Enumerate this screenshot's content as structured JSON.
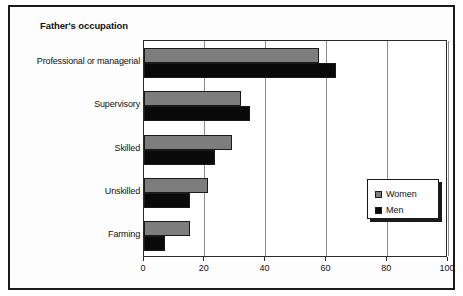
{
  "figure": {
    "title": "Father's occupation"
  },
  "chart_data": {
    "type": "bar",
    "orientation": "horizontal",
    "title": "Father's occupation",
    "xlabel": "",
    "ylabel": "",
    "xlim": [
      0,
      100
    ],
    "xticks": [
      0,
      20,
      40,
      60,
      80,
      100
    ],
    "xtick_labels": [
      "0",
      "20",
      "40",
      "60",
      "80",
      "100"
    ],
    "grid": "vertical",
    "legend_position": "lower-right",
    "categories": [
      "Professional or managerial",
      "Supervisory",
      "Skilled",
      "Unskilled",
      "Farming"
    ],
    "series": [
      {
        "name": "Women",
        "color": "#7d7d7d",
        "values": [
          57.5,
          32,
          29,
          21,
          15
        ]
      },
      {
        "name": "Men",
        "color": "#0a0a0a",
        "values": [
          63,
          35,
          23.5,
          15,
          7
        ]
      }
    ]
  },
  "legend": {
    "entries": [
      {
        "label": "Women",
        "swatch": "women"
      },
      {
        "label": "Men",
        "swatch": "men"
      }
    ]
  }
}
